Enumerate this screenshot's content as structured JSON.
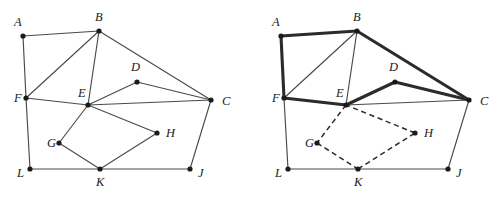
{
  "figure": {
    "colors": {
      "background": "#ffffff",
      "edge_thin": "#4a4a4a",
      "edge_bold": "#2b2b2b",
      "edge_dashed": "#2b2b2b",
      "vertex": "#1a1a1a",
      "label": "#1a1a1a"
    },
    "panels": [
      {
        "id": "left-graph",
        "name": "original-graph",
        "origin_x": 0,
        "vertices": [
          {
            "id": "A",
            "label": "A",
            "x": 23,
            "y": 36,
            "lx": 14,
            "ly": 23
          },
          {
            "id": "B",
            "label": "B",
            "x": 99,
            "y": 31,
            "lx": 95,
            "ly": 18
          },
          {
            "id": "C",
            "label": "C",
            "x": 211,
            "y": 100,
            "lx": 222,
            "ly": 102
          },
          {
            "id": "D",
            "label": "D",
            "x": 137,
            "y": 82,
            "lx": 131,
            "ly": 68
          },
          {
            "id": "E",
            "label": "E",
            "x": 88,
            "y": 105,
            "lx": 78,
            "ly": 94
          },
          {
            "id": "F",
            "label": "F",
            "x": 26,
            "y": 98,
            "lx": 14,
            "ly": 99
          },
          {
            "id": "G",
            "label": "G",
            "x": 59,
            "y": 143,
            "lx": 47,
            "ly": 144
          },
          {
            "id": "H",
            "label": "H",
            "x": 157,
            "y": 133,
            "lx": 166,
            "ly": 134
          },
          {
            "id": "J",
            "label": "J",
            "x": 190,
            "y": 169,
            "lx": 198,
            "ly": 174
          },
          {
            "id": "K",
            "label": "K",
            "x": 100,
            "y": 169,
            "lx": 96,
            "ly": 183
          },
          {
            "id": "L",
            "label": "L",
            "x": 30,
            "y": 169,
            "lx": 17,
            "ly": 174
          }
        ],
        "edges": [
          {
            "from": "A",
            "to": "B",
            "style": "thin"
          },
          {
            "from": "A",
            "to": "F",
            "style": "thin"
          },
          {
            "from": "F",
            "to": "B",
            "style": "thin"
          },
          {
            "from": "B",
            "to": "E",
            "style": "thin"
          },
          {
            "from": "B",
            "to": "C",
            "style": "thin"
          },
          {
            "from": "F",
            "to": "E",
            "style": "thin"
          },
          {
            "from": "F",
            "to": "L",
            "style": "thin"
          },
          {
            "from": "E",
            "to": "D",
            "style": "thin"
          },
          {
            "from": "D",
            "to": "C",
            "style": "thin"
          },
          {
            "from": "E",
            "to": "C",
            "style": "thin"
          },
          {
            "from": "E",
            "to": "G",
            "style": "thin"
          },
          {
            "from": "E",
            "to": "H",
            "style": "thin"
          },
          {
            "from": "G",
            "to": "K",
            "style": "thin"
          },
          {
            "from": "H",
            "to": "K",
            "style": "thin"
          },
          {
            "from": "L",
            "to": "K",
            "style": "thin"
          },
          {
            "from": "K",
            "to": "J",
            "style": "thin"
          },
          {
            "from": "J",
            "to": "C",
            "style": "thin"
          }
        ]
      },
      {
        "id": "right-graph",
        "name": "highlighted-graph",
        "origin_x": 258,
        "vertices": [
          {
            "id": "A",
            "label": "A",
            "x": 23,
            "y": 36,
            "lx": 14,
            "ly": 23
          },
          {
            "id": "B",
            "label": "B",
            "x": 99,
            "y": 31,
            "lx": 95,
            "ly": 18
          },
          {
            "id": "C",
            "label": "C",
            "x": 211,
            "y": 100,
            "lx": 222,
            "ly": 102
          },
          {
            "id": "D",
            "label": "D",
            "x": 137,
            "y": 82,
            "lx": 131,
            "ly": 68
          },
          {
            "id": "E",
            "label": "E",
            "x": 88,
            "y": 105,
            "lx": 78,
            "ly": 94
          },
          {
            "id": "F",
            "label": "F",
            "x": 26,
            "y": 98,
            "lx": 14,
            "ly": 99
          },
          {
            "id": "G",
            "label": "G",
            "x": 59,
            "y": 143,
            "lx": 47,
            "ly": 144
          },
          {
            "id": "H",
            "label": "H",
            "x": 157,
            "y": 133,
            "lx": 166,
            "ly": 134
          },
          {
            "id": "J",
            "label": "J",
            "x": 190,
            "y": 169,
            "lx": 198,
            "ly": 174
          },
          {
            "id": "K",
            "label": "K",
            "x": 100,
            "y": 169,
            "lx": 96,
            "ly": 183
          },
          {
            "id": "L",
            "label": "L",
            "x": 30,
            "y": 169,
            "lx": 17,
            "ly": 174
          }
        ],
        "edges": [
          {
            "from": "A",
            "to": "B",
            "style": "bold"
          },
          {
            "from": "A",
            "to": "F",
            "style": "bold"
          },
          {
            "from": "F",
            "to": "E",
            "style": "bold"
          },
          {
            "from": "B",
            "to": "C",
            "style": "bold"
          },
          {
            "from": "E",
            "to": "D",
            "style": "bold"
          },
          {
            "from": "D",
            "to": "C",
            "style": "bold"
          },
          {
            "from": "F",
            "to": "B",
            "style": "thin"
          },
          {
            "from": "B",
            "to": "E",
            "style": "thin"
          },
          {
            "from": "E",
            "to": "C",
            "style": "thin"
          },
          {
            "from": "F",
            "to": "L",
            "style": "thin"
          },
          {
            "from": "L",
            "to": "K",
            "style": "thin"
          },
          {
            "from": "K",
            "to": "J",
            "style": "thin"
          },
          {
            "from": "J",
            "to": "C",
            "style": "thin"
          },
          {
            "from": "E",
            "to": "G",
            "style": "dashed"
          },
          {
            "from": "G",
            "to": "K",
            "style": "dashed"
          },
          {
            "from": "K",
            "to": "H",
            "style": "dashed"
          },
          {
            "from": "H",
            "to": "E",
            "style": "dashed"
          }
        ]
      }
    ]
  }
}
